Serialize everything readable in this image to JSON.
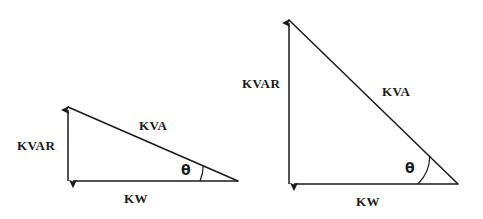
{
  "figure": {
    "background_color": "#ffffff",
    "stroke_color": "#1a1a1a",
    "text_color": "#1a1a1a",
    "width": 483,
    "height": 219
  },
  "triangles": [
    {
      "id": "left",
      "name": "high-power-factor-triangle",
      "labels": {
        "vertical": "KVAR",
        "hypotenuse": "KVA",
        "horizontal": "KW",
        "angle": "θ"
      },
      "geometry": {
        "apex": [
          68,
          106
        ],
        "corner": [
          68,
          181
        ],
        "right_vertex": [
          238,
          181
        ],
        "vertical_length_px": 75,
        "horizontal_length_px": 170,
        "angle_degrees": 24,
        "arc_radius_px": 38
      }
    },
    {
      "id": "right",
      "name": "low-power-factor-triangle",
      "labels": {
        "vertical": "KVAR",
        "hypotenuse": "KVA",
        "horizontal": "KW",
        "angle": "θ"
      },
      "geometry": {
        "apex": [
          289,
          19
        ],
        "corner": [
          289,
          184
        ],
        "right_vertex": [
          458,
          184
        ],
        "vertical_length_px": 165,
        "horizontal_length_px": 169,
        "angle_degrees": 44,
        "arc_radius_px": 40
      }
    }
  ]
}
